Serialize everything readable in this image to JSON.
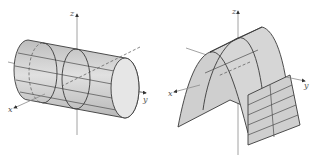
{
  "figures": [
    {
      "name": "cylinder",
      "description": "Circular cylinder with axis along y-axis",
      "axes": {
        "x_label": "x",
        "y_label": "y",
        "z_label": "z"
      },
      "colors": {
        "surface": "#cfcfcf",
        "end_cap": "#e4e4e4",
        "edge": "#3a3a3a"
      }
    },
    {
      "name": "parabolic-cylinder",
      "description": "Parabolic cylinder opening downward",
      "axes": {
        "x_label": "x",
        "y_label": "y",
        "z_label": "z"
      },
      "colors": {
        "surface": "#cfcfcf",
        "edge": "#3a3a3a"
      }
    }
  ]
}
